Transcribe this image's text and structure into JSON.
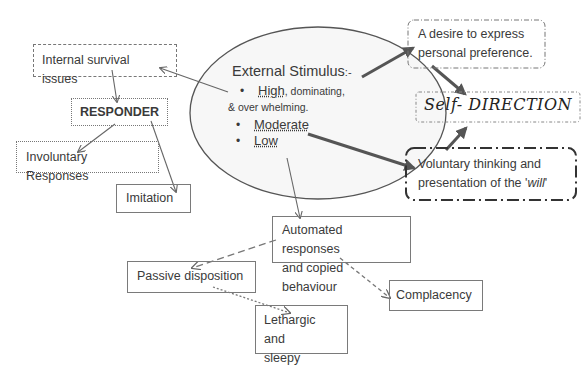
{
  "diagram": {
    "colors": {
      "line": "#666666",
      "thick_line": "#555555",
      "text": "#3a3a3a",
      "ellipse_fill": "#f7f7f7"
    },
    "center": {
      "title": "External Stimulus",
      "title_suffix": ":-",
      "items": [
        {
          "bullet": "•",
          "label": "High",
          "rest": ", dominating,",
          "continuation": "& over   whelming."
        },
        {
          "bullet": "•",
          "label": "Moderate"
        },
        {
          "bullet": "•",
          "label": "Low"
        }
      ]
    },
    "nodes": {
      "internal_survival": "Internal survival issues",
      "responder": "RESPONDER",
      "involuntary": "Involuntary Responses",
      "imitation": "Imitation",
      "desire_line1": "A desire to express",
      "desire_line2": "personal preference.",
      "self_direction": "Self- DIRECTION",
      "voluntary_line1": "Voluntary thinking and",
      "voluntary_line2_prefix": "presentation of the '",
      "voluntary_line2_em": "will",
      "voluntary_line2_suffix": "'",
      "automated_line1": "Automated responses",
      "automated_line2": "and copied behaviour",
      "passive": "Passive disposition",
      "lethargic_line1": "Lethargic and",
      "lethargic_line2": "sleepy",
      "complacency": "Complacency"
    },
    "edges": [
      {
        "from": "external-stimulus",
        "to": "internal-survival-issues",
        "style": "thin"
      },
      {
        "from": "internal-survival-issues",
        "to": "responder",
        "style": "thin"
      },
      {
        "from": "responder",
        "to": "involuntary-responses",
        "style": "thin"
      },
      {
        "from": "responder",
        "to": "imitation",
        "style": "thin"
      },
      {
        "from": "high",
        "to": "desire-to-express",
        "style": "thick"
      },
      {
        "from": "desire-to-express",
        "to": "self-direction",
        "style": "thick"
      },
      {
        "from": "moderate",
        "to": "voluntary-thinking",
        "style": "thick"
      },
      {
        "from": "voluntary-thinking",
        "to": "self-direction",
        "style": "thick"
      },
      {
        "from": "low",
        "to": "automated-responses",
        "style": "thin"
      },
      {
        "from": "automated-responses",
        "to": "passive-disposition",
        "style": "dashed"
      },
      {
        "from": "automated-responses",
        "to": "complacency",
        "style": "dashed"
      },
      {
        "from": "passive-disposition",
        "to": "lethargic-and-sleepy",
        "style": "dotted"
      }
    ]
  }
}
